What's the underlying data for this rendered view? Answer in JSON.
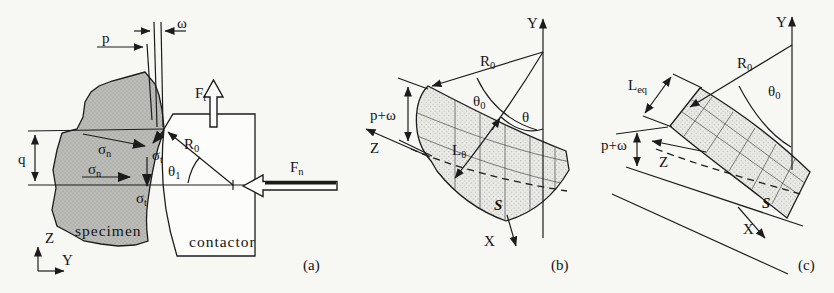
{
  "figure": {
    "background": "#f7f7f4",
    "ink": "#1c1c1c",
    "captions": {
      "a": "(a)",
      "b": "(b)",
      "c": "(c)"
    },
    "fig_a": {
      "labels": {
        "p": "p",
        "omega": "ω",
        "q": "q",
        "sigma_n": {
          "main": "σ",
          "sub": "n"
        },
        "sigma_t": {
          "main": "σ",
          "sub": "t"
        },
        "F_t": {
          "main": "F",
          "sub": "t"
        },
        "F_n": {
          "main": "F",
          "sub": "n"
        },
        "R_0": {
          "main": "R",
          "sub": "0"
        },
        "theta_1": {
          "main": "θ",
          "sub": "1"
        },
        "specimen": "specimen",
        "contactor": "contactor",
        "axis_z": "Z",
        "axis_y": "Y"
      },
      "colors": {
        "specimen_fill": "#bcbcb8",
        "contactor_fill": "#fcfcfa"
      }
    },
    "fig_b": {
      "labels": {
        "axis_y": "Y",
        "axis_z": "Z",
        "axis_x": "X",
        "R_0": {
          "main": "R",
          "sub": "0"
        },
        "theta_0": {
          "main": "θ",
          "sub": "0"
        },
        "theta": "θ",
        "L_theta": {
          "main": "L",
          "sub": "θ"
        },
        "p_omega": "p+ω",
        "S": "S"
      }
    },
    "fig_c": {
      "labels": {
        "axis_y": "Y",
        "axis_z": "Z",
        "axis_x": "X",
        "R_0": {
          "main": "R",
          "sub": "0"
        },
        "theta_0": {
          "main": "θ",
          "sub": "0"
        },
        "L_eq": {
          "main": "L",
          "sub": "eq"
        },
        "p_omega": "p+ω",
        "S": "S"
      }
    }
  }
}
